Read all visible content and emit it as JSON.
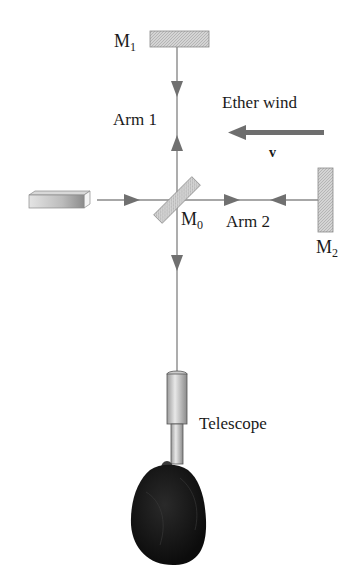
{
  "diagram": {
    "labels": {
      "mirror_1": "M",
      "mirror_1_sub": "1",
      "mirror_0": "M",
      "mirror_0_sub": "0",
      "mirror_2": "M",
      "mirror_2_sub": "2",
      "arm_1": "Arm 1",
      "arm_2": "Arm 2",
      "ether_wind": "Ether wind",
      "velocity": "v",
      "telescope": "Telescope"
    },
    "components": [
      {
        "id": "light-source",
        "kind": "source"
      },
      {
        "id": "beam-splitter",
        "label": "M0",
        "kind": "half-silvered mirror"
      },
      {
        "id": "mirror-1",
        "label": "M1",
        "kind": "mirror"
      },
      {
        "id": "mirror-2",
        "label": "M2",
        "kind": "mirror"
      },
      {
        "id": "telescope",
        "label": "Telescope",
        "kind": "detector"
      }
    ],
    "colors": {
      "beam": "#8a8a8a",
      "mirror_fill": "#cfcfcf",
      "wind_arrow": "#6e6e6e",
      "text": "#1a1a1a"
    }
  }
}
